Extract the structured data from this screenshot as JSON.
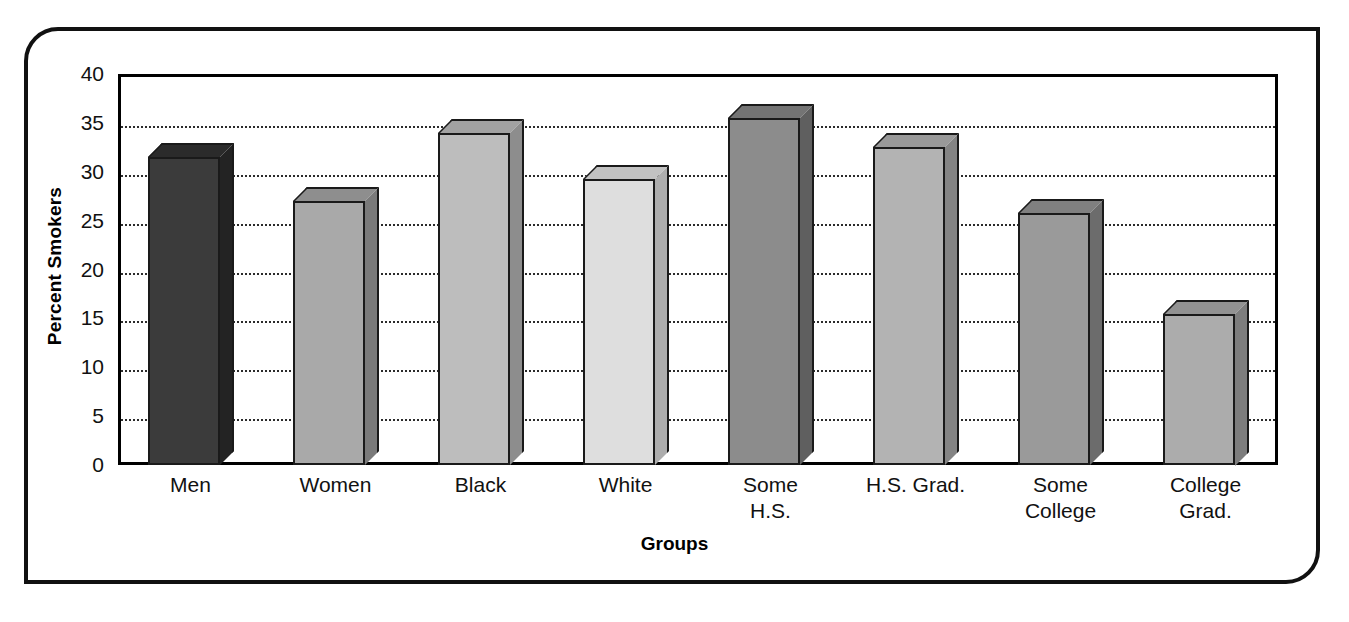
{
  "chart_data": {
    "type": "bar",
    "title": "",
    "xlabel": "Groups",
    "ylabel": "Percent Smokers",
    "ylim": [
      0,
      40
    ],
    "ytick_labels": [
      "40",
      "35",
      "30",
      "25",
      "20",
      "15",
      "10",
      "5",
      "0"
    ],
    "yticks": [
      40,
      35,
      30,
      25,
      20,
      15,
      10,
      5,
      0
    ],
    "grid": "horizontal-dotted",
    "legend": "none",
    "style": "3d-extruded-bars",
    "categories": [
      "Men",
      "Women",
      "Black",
      "White",
      "Some H.S.",
      "H.S. Grad.",
      "Some College",
      "College Grad."
    ],
    "category_lines": [
      [
        "Men"
      ],
      [
        "Women"
      ],
      [
        "Black"
      ],
      [
        "White"
      ],
      [
        "Some",
        "H.S."
      ],
      [
        "H.S. Grad."
      ],
      [
        "Some",
        "College"
      ],
      [
        "College",
        "Grad."
      ]
    ],
    "values": [
      31.5,
      27.0,
      34.0,
      29.3,
      35.5,
      32.5,
      25.8,
      15.5
    ],
    "bar_colors": [
      "#3b3b3b",
      "#a9a9a9",
      "#bdbdbd",
      "#dedede",
      "#8c8c8c",
      "#b3b3b3",
      "#9a9a9a",
      "#acacac"
    ],
    "bar_top_colors": [
      "#2b2b2b",
      "#8e8e8e",
      "#a2a2a2",
      "#c2c2c2",
      "#747474",
      "#999999",
      "#808080",
      "#929292"
    ],
    "bar_side_colors": [
      "#232323",
      "#7a7a7a",
      "#8d8d8d",
      "#adadad",
      "#5f5f5f",
      "#848484",
      "#6c6c6c",
      "#7d7d7d"
    ]
  },
  "colors": {
    "frame": "#111111",
    "axis": "#000000",
    "grid": "#2b2b2b",
    "background": "#ffffff"
  }
}
